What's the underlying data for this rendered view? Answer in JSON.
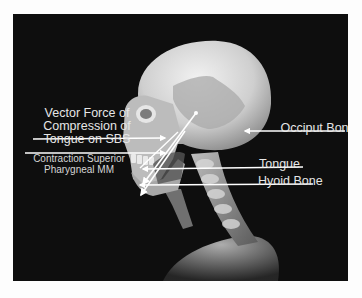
{
  "diagram": {
    "background_color": "#0e0e0e",
    "label_color": "#e6e6e6",
    "labels": {
      "vector_force": "Vector Force of Compression of Tongue on SBS",
      "vector_force_lines": [
        "Vector Force of",
        "Compression of",
        "Tongue on SBS"
      ],
      "contraction_lines": [
        "Contraction Superior",
        "Pharygneal MM"
      ],
      "occiput": "Occiput Bone",
      "tongue": "Tongue",
      "hyoid": "Hyoid Bone"
    }
  }
}
